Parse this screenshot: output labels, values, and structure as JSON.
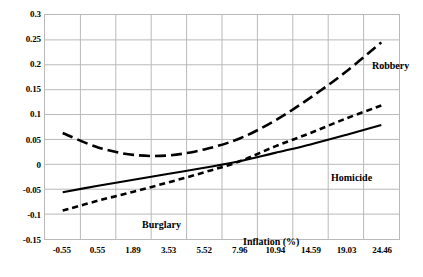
{
  "chart_data": {
    "type": "line",
    "title": "",
    "subtitle": "",
    "xlabel": "Inflation (%)",
    "ylabel": "",
    "grid": true,
    "legend_position": "inline-annotations",
    "x_tick_labels": [
      "-0.55",
      "0.55",
      "1.89",
      "3.53",
      "5.52",
      "7.96",
      "10.94",
      "14.59",
      "19.03",
      "24.46"
    ],
    "x_values": [
      -0.55,
      0.55,
      1.89,
      3.53,
      5.52,
      7.96,
      10.94,
      14.59,
      19.03,
      24.46
    ],
    "y_tick_labels": [
      "0.3",
      "0.25",
      "0.2",
      "0.15",
      "0.1",
      "0.05",
      "0",
      "-0.05",
      "-0.1",
      "-0.15"
    ],
    "y_values": [
      0.3,
      0.25,
      0.2,
      0.15,
      0.1,
      0.05,
      0,
      -0.05,
      -0.1,
      -0.15
    ],
    "ylim": [
      -0.15,
      0.3
    ],
    "series": [
      {
        "name": "Robbery",
        "style": "long-dashed",
        "color": "#000000",
        "values": [
          0.063,
          0.034,
          0.019,
          0.018,
          0.03,
          0.052,
          0.088,
          0.134,
          0.186,
          0.245
        ]
      },
      {
        "name": "Burglary",
        "style": "short-dashed",
        "color": "#000000",
        "values": [
          -0.093,
          -0.073,
          -0.055,
          -0.036,
          -0.016,
          0.006,
          0.036,
          0.063,
          0.092,
          0.118
        ]
      },
      {
        "name": "Homicide",
        "style": "solid",
        "color": "#000000",
        "values": [
          -0.056,
          -0.043,
          -0.031,
          -0.019,
          -0.007,
          0.006,
          0.023,
          0.04,
          0.059,
          0.079
        ]
      }
    ],
    "annotations": [
      {
        "text": "Robbery",
        "x": 19.03,
        "y": 0.268
      },
      {
        "text": "Homicide",
        "x": 12.7,
        "y": -0.012
      },
      {
        "text": "Burglary",
        "x": 1.2,
        "y": -0.105
      },
      {
        "text": "Inflation (%)",
        "x": 7.2,
        "y": -0.138
      }
    ],
    "colors": {
      "grid": "#b9b9b9",
      "axis_text": "#000000",
      "series": "#000000",
      "background": "#ffffff"
    }
  }
}
